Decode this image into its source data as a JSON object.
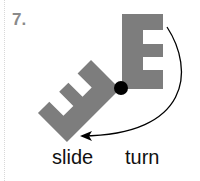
{
  "problem": {
    "number": "7.",
    "shape_letter": "E",
    "options": [
      "slide",
      "turn"
    ],
    "colors": {
      "shape": "#7d7d7d",
      "pivot": "#000000",
      "arrow": "#000000",
      "number": "#8a8a8a"
    }
  }
}
